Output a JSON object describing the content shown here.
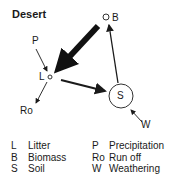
{
  "title": "Desert",
  "nodes": {
    "B": "B",
    "L": "L",
    "S": "S",
    "P": "P",
    "Ro": "Ro",
    "W": "W"
  },
  "legend": [
    {
      "key": "L",
      "value": "Litter",
      "key2": "P",
      "value2": "Precipitation"
    },
    {
      "key": "B",
      "value": "Biomass",
      "key2": "Ro",
      "value2": "Run off"
    },
    {
      "key": "S",
      "value": "Soil",
      "key2": "W",
      "value2": "Weathering"
    }
  ]
}
